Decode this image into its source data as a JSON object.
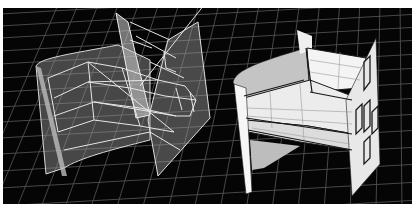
{
  "figure": {
    "colors": {
      "background": "#050505",
      "grid": "#6a6a6a",
      "wire_surface": "#8c8c8c",
      "wire_edge": "#e6e6e6",
      "shaded_light": "#f2f2f2",
      "shaded_mid": "#cfcfcf",
      "shaded_dark": "#a8a8a8",
      "edge_dark": "#1a1a1a",
      "frame": "#ffffff"
    },
    "panels": [
      {
        "name": "wireframe-model",
        "render_style": "translucent wireframe"
      },
      {
        "name": "shaded-model",
        "render_style": "opaque shaded"
      }
    ]
  }
}
